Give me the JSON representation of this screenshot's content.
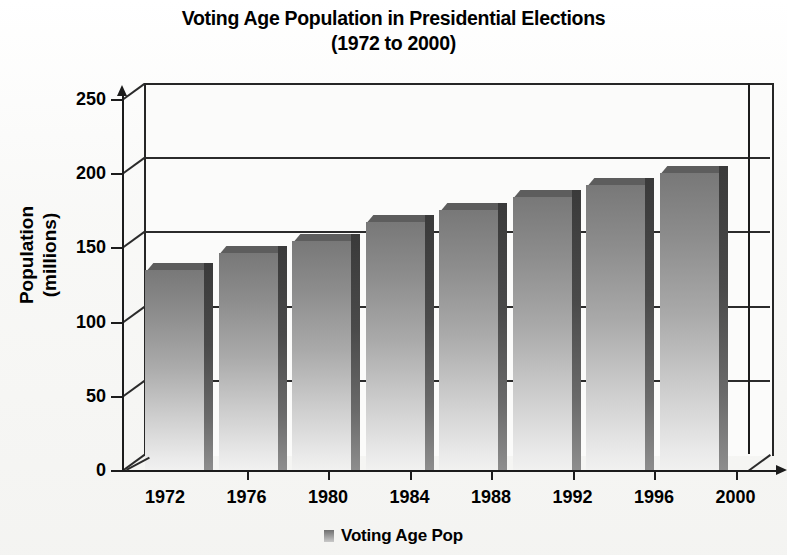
{
  "chart_data": {
    "type": "bar",
    "title": "Voting Age Population in Presidential Elections",
    "subtitle": "(1972 to 2000)",
    "xlabel": "",
    "ylabel": "Population\n(millions)",
    "ylabel_line1": "Population",
    "ylabel_line2": "(millions)",
    "categories": [
      "1972",
      "1976",
      "1980",
      "1984",
      "1988",
      "1992",
      "1996",
      "2000"
    ],
    "values": [
      135,
      146,
      154,
      167,
      175,
      184,
      192,
      200
    ],
    "series": [
      {
        "name": "Voting Age Pop",
        "values": [
          135,
          146,
          154,
          167,
          175,
          184,
          192,
          200
        ]
      }
    ],
    "ylim": [
      0,
      250
    ],
    "yticks": [
      0,
      50,
      100,
      150,
      200,
      250
    ],
    "ytick_labels": [
      "0",
      "50",
      "100",
      "150",
      "200",
      "250"
    ],
    "grid": true,
    "grid_axis": "y",
    "legend": {
      "position": "bottom-center",
      "entries": [
        {
          "label": "Voting Age Pop",
          "color": "#8a8a8a"
        }
      ]
    },
    "style": {
      "three_d": true,
      "bar_color": "#8a8a8a",
      "bar_gradient_top": "#787878",
      "bar_gradient_bottom": "#f1f1f0",
      "axis_color": "#1c1c1c",
      "background": "#ffffff",
      "plot_background": "#fbfbfa"
    }
  },
  "legend": {
    "entry_label": "Voting Age Pop"
  }
}
